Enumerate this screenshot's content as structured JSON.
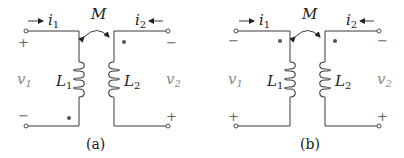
{
  "figures": [
    {
      "id": "a",
      "caption": "(a)",
      "mutual_label": "M",
      "coil_left": {
        "label": "L",
        "sub": "1"
      },
      "coil_right": {
        "label": "L",
        "sub": "2"
      },
      "current_left": {
        "label": "i",
        "sub": "1",
        "direction": "right"
      },
      "current_right": {
        "label": "i",
        "sub": "2",
        "direction": "left"
      },
      "voltage_left": {
        "label": "v",
        "sub": "1",
        "top_sign": "+",
        "bottom_sign": "−"
      },
      "voltage_right": {
        "label": "v",
        "sub": "2",
        "top_sign": "−",
        "bottom_sign": "+"
      },
      "dots": [
        "right-coil-top",
        "left-coil-bottom"
      ]
    },
    {
      "id": "b",
      "caption": "(b)",
      "mutual_label": "M",
      "coil_left": {
        "label": "L",
        "sub": "1"
      },
      "coil_right": {
        "label": "L",
        "sub": "2"
      },
      "current_left": {
        "label": "i",
        "sub": "1",
        "direction": "right"
      },
      "current_right": {
        "label": "i",
        "sub": "2",
        "direction": "left"
      },
      "voltage_left": {
        "label": "v",
        "sub": "1",
        "top_sign": "−",
        "bottom_sign": "+"
      },
      "voltage_right": {
        "label": "v",
        "sub": "2",
        "top_sign": "−",
        "bottom_sign": "+"
      },
      "dots": [
        "left-coil-top",
        "right-coil-top"
      ]
    }
  ],
  "colors": {
    "wire": "#3a3a3a",
    "text": "#222222",
    "voltage_text": "#888888"
  }
}
